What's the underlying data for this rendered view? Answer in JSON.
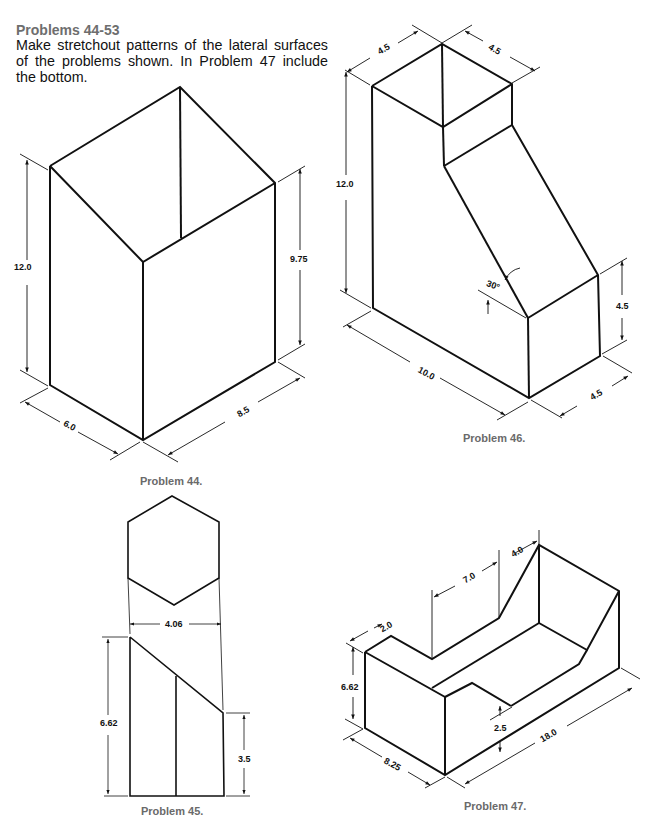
{
  "header": {
    "title": "Problems 44-53",
    "instructions": "Make stretchout patterns of the lateral surfaces of the problems shown. In Problem 47 include the bottom."
  },
  "figures": [
    {
      "id": "p44",
      "caption": "Problem 44.",
      "dimensions": {
        "height_left": "12.0",
        "height_right": "9.75",
        "depth": "6.0",
        "width": "8.5"
      }
    },
    {
      "id": "p45",
      "caption": "Problem 45.",
      "dimensions": {
        "across_flats": "4.06",
        "height_left": "6.62",
        "height_right": "3.5"
      }
    },
    {
      "id": "p46",
      "caption": "Problem 46.",
      "dimensions": {
        "top_left": "4.5",
        "top_right": "4.5",
        "height": "12.0",
        "angle": "30°",
        "lower_height": "4.5",
        "length": "10.0",
        "lower_depth": "4.5"
      }
    },
    {
      "id": "p47",
      "caption": "Problem 47.",
      "dimensions": {
        "top_left": "2.0",
        "mid": "7.0",
        "top_right": "4.0",
        "height": "6.62",
        "notch": "2.5",
        "length": "18.0",
        "depth": "8.25"
      }
    }
  ],
  "colors": {
    "line": "#111111",
    "caption": "#6a6a6a",
    "heading": "#6e6e6e"
  }
}
